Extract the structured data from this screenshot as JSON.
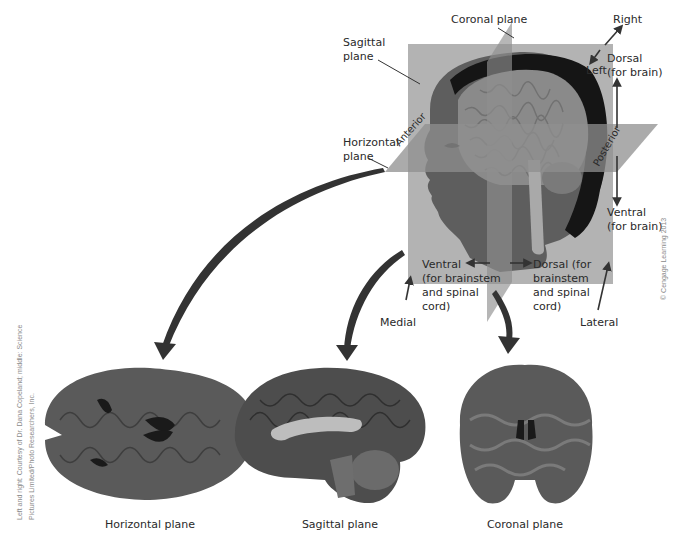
{
  "diagram": {
    "labels": {
      "coronal_plane": "Coronal plane",
      "sagittal_plane": "Sagittal\nplane",
      "horizontal_plane": "Horizontal\nplane",
      "right": "Right",
      "left": "Left",
      "dorsal_brain": "Dorsal\n(for brain)",
      "ventral_brain": "Ventral\n(for brain)",
      "anterior": "Anterior",
      "posterior": "Posterior",
      "ventral_brainstem": "Ventral\n(for brainstem\nand spinal\ncord)",
      "dorsal_brainstem": "Dorsal (for\nbrainstem\nand spinal\ncord)",
      "medial": "Medial",
      "lateral": "Lateral"
    },
    "sections": [
      {
        "name": "horizontal",
        "caption": "Horizontal plane"
      },
      {
        "name": "sagittal",
        "caption": "Sagittal plane"
      },
      {
        "name": "coronal",
        "caption": "Coronal plane"
      }
    ],
    "copyright": "© Cengage Learning 2013",
    "photo_credit_line1": "Left and right: Courtesy of Dr. Dana Copeland; middle: Science",
    "photo_credit_line2": "Pictures Limited/Photo Researchers, Inc."
  },
  "colors": {
    "plane_fill": "#b3b3b3",
    "plane_dark": "#8f8f8f",
    "head_skin": "#5e5e5e",
    "brain": "#8a8a8a",
    "scalp_band": "#151515",
    "arrow": "#333333",
    "section_tissue": "#5a5a5a"
  }
}
